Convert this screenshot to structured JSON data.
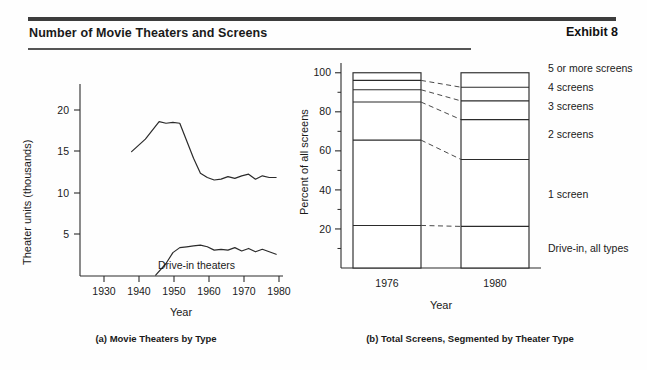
{
  "header": {
    "title": "Number of Movie Theaters and Screens",
    "exhibit": "Exhibit 8"
  },
  "captions": {
    "a": "(a) Movie Theaters by Type",
    "b": "(b) Total Screens, Segmented by Theater Type"
  },
  "chart_data": [
    {
      "type": "line",
      "title": "(a) Movie Theaters by Type",
      "xlabel": "Year",
      "ylabel": "Theater units (thousands)",
      "xlim": [
        1923,
        1982
      ],
      "ylim": [
        0,
        23
      ],
      "xticks": [
        1930,
        1940,
        1950,
        1960,
        1970,
        1980
      ],
      "yticks": [
        5,
        10,
        15,
        20
      ],
      "grid": false,
      "legend_position": "inline-annotation",
      "annotations": [
        "Drive-in theaters"
      ],
      "series": [
        {
          "name": "Indoor theaters",
          "x": [
            1938,
            1942,
            1946,
            1948,
            1950,
            1952,
            1954,
            1956,
            1958,
            1960,
            1962,
            1964,
            1966,
            1968,
            1970,
            1972,
            1974,
            1976,
            1978,
            1980
          ],
          "values": [
            14.9,
            16.4,
            18.5,
            18.3,
            18.4,
            18.3,
            16.2,
            14.1,
            12.3,
            11.8,
            11.5,
            11.6,
            11.9,
            11.7,
            12.0,
            12.2,
            11.6,
            12.0,
            11.8,
            11.8
          ]
        },
        {
          "name": "Drive-in theaters",
          "x": [
            1945,
            1948,
            1950,
            1952,
            1954,
            1956,
            1958,
            1960,
            1962,
            1964,
            1966,
            1968,
            1970,
            1972,
            1974,
            1976,
            1978,
            1980
          ],
          "values": [
            0.1,
            1.5,
            2.8,
            3.4,
            3.5,
            3.6,
            3.7,
            3.5,
            3.1,
            3.2,
            3.1,
            3.4,
            3.0,
            3.3,
            2.9,
            3.2,
            2.9,
            2.6
          ]
        }
      ]
    },
    {
      "type": "bar",
      "stacked": true,
      "title": "(b) Total Screens, Segmented by Theater Type",
      "xlabel": "Year",
      "ylabel": "Percent of all screens",
      "categories": [
        "1976",
        "1980"
      ],
      "ylim": [
        0,
        100
      ],
      "yticks": [
        20,
        40,
        60,
        80,
        100
      ],
      "grid": false,
      "legend_position": "right",
      "segments": [
        {
          "name": "Drive-in, all types",
          "values": [
            21.8,
            21.3
          ]
        },
        {
          "name": "1 screen",
          "values": [
            43.7,
            34.3
          ]
        },
        {
          "name": "2 screens",
          "values": [
            19.5,
            20.4
          ]
        },
        {
          "name": "3 screens",
          "values": [
            6.3,
            9.6
          ]
        },
        {
          "name": "4 screens",
          "values": [
            4.8,
            7.0
          ]
        },
        {
          "name": "5 or more screens",
          "values": [
            3.9,
            7.4
          ]
        }
      ],
      "cumulative_boundaries": {
        "1976": [
          0,
          21.8,
          65.5,
          85.0,
          91.3,
          96.1,
          100.0
        ],
        "1980": [
          0,
          21.3,
          55.6,
          76.0,
          85.6,
          92.6,
          100.0
        ]
      },
      "legend": [
        "5 or more screens",
        "4 screens",
        "3 screens",
        "2 screens",
        "1 screen",
        "Drive-in, all types"
      ]
    }
  ]
}
